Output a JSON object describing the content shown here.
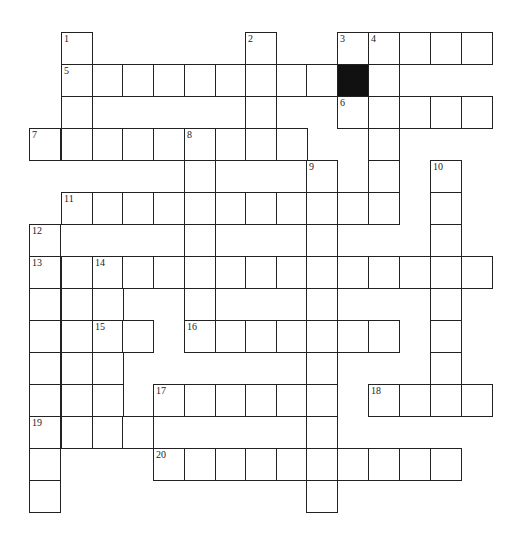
{
  "puzzle": {
    "type": "crossword",
    "colors": {
      "grid_line": "#222222",
      "block": "#111111",
      "background": "#ffffff"
    },
    "geometry": {
      "col_left": [
        29,
        61,
        92,
        122,
        153,
        184,
        215,
        245,
        276,
        306,
        337,
        368,
        399,
        430,
        461
      ],
      "row_top": [
        32,
        64,
        96,
        128,
        160,
        192,
        224,
        256,
        288,
        320,
        352,
        384,
        416,
        448,
        480
      ],
      "cell_w": 32,
      "cell_h": 33
    },
    "cells": [
      {
        "r": 0,
        "c": 1,
        "n": "1"
      },
      {
        "r": 0,
        "c": 7,
        "n": "2"
      },
      {
        "r": 0,
        "c": 10,
        "n": "3"
      },
      {
        "r": 0,
        "c": 11,
        "n": "4"
      },
      {
        "r": 0,
        "c": 12
      },
      {
        "r": 0,
        "c": 13
      },
      {
        "r": 0,
        "c": 14
      },
      {
        "r": 1,
        "c": 1,
        "n": "5"
      },
      {
        "r": 1,
        "c": 2
      },
      {
        "r": 1,
        "c": 3
      },
      {
        "r": 1,
        "c": 4
      },
      {
        "r": 1,
        "c": 5
      },
      {
        "r": 1,
        "c": 6
      },
      {
        "r": 1,
        "c": 7
      },
      {
        "r": 1,
        "c": 8
      },
      {
        "r": 1,
        "c": 9
      },
      {
        "r": 1,
        "c": 10,
        "black": true
      },
      {
        "r": 1,
        "c": 11
      },
      {
        "r": 2,
        "c": 1
      },
      {
        "r": 2,
        "c": 7
      },
      {
        "r": 2,
        "c": 10,
        "n": "6"
      },
      {
        "r": 2,
        "c": 11
      },
      {
        "r": 2,
        "c": 12
      },
      {
        "r": 2,
        "c": 13
      },
      {
        "r": 2,
        "c": 14
      },
      {
        "r": 3,
        "c": 0,
        "n": "7"
      },
      {
        "r": 3,
        "c": 1
      },
      {
        "r": 3,
        "c": 2
      },
      {
        "r": 3,
        "c": 3
      },
      {
        "r": 3,
        "c": 4
      },
      {
        "r": 3,
        "c": 5,
        "n": "8"
      },
      {
        "r": 3,
        "c": 6
      },
      {
        "r": 3,
        "c": 7
      },
      {
        "r": 3,
        "c": 8
      },
      {
        "r": 3,
        "c": 11
      },
      {
        "r": 4,
        "c": 5
      },
      {
        "r": 4,
        "c": 9,
        "n": "9"
      },
      {
        "r": 4,
        "c": 11
      },
      {
        "r": 4,
        "c": 13,
        "n": "10"
      },
      {
        "r": 5,
        "c": 1,
        "n": "11"
      },
      {
        "r": 5,
        "c": 2
      },
      {
        "r": 5,
        "c": 3
      },
      {
        "r": 5,
        "c": 4
      },
      {
        "r": 5,
        "c": 5
      },
      {
        "r": 5,
        "c": 6
      },
      {
        "r": 5,
        "c": 7
      },
      {
        "r": 5,
        "c": 8
      },
      {
        "r": 5,
        "c": 9
      },
      {
        "r": 5,
        "c": 10
      },
      {
        "r": 5,
        "c": 11
      },
      {
        "r": 5,
        "c": 13
      },
      {
        "r": 6,
        "c": 0,
        "n": "12"
      },
      {
        "r": 6,
        "c": 5
      },
      {
        "r": 6,
        "c": 9
      },
      {
        "r": 6,
        "c": 13
      },
      {
        "r": 7,
        "c": 0,
        "n": "13"
      },
      {
        "r": 7,
        "c": 1
      },
      {
        "r": 7,
        "c": 2,
        "n": "14"
      },
      {
        "r": 7,
        "c": 3
      },
      {
        "r": 7,
        "c": 4
      },
      {
        "r": 7,
        "c": 5
      },
      {
        "r": 7,
        "c": 6
      },
      {
        "r": 7,
        "c": 7
      },
      {
        "r": 7,
        "c": 8
      },
      {
        "r": 7,
        "c": 9
      },
      {
        "r": 7,
        "c": 10
      },
      {
        "r": 7,
        "c": 11
      },
      {
        "r": 7,
        "c": 12
      },
      {
        "r": 7,
        "c": 13
      },
      {
        "r": 7,
        "c": 14
      },
      {
        "r": 8,
        "c": 0
      },
      {
        "r": 8,
        "c": 1
      },
      {
        "r": 8,
        "c": 2
      },
      {
        "r": 8,
        "c": 5
      },
      {
        "r": 8,
        "c": 9
      },
      {
        "r": 8,
        "c": 13
      },
      {
        "r": 9,
        "c": 0
      },
      {
        "r": 9,
        "c": 1
      },
      {
        "r": 9,
        "c": 2,
        "n": "15"
      },
      {
        "r": 9,
        "c": 3
      },
      {
        "r": 9,
        "c": 5,
        "n": "16"
      },
      {
        "r": 9,
        "c": 6
      },
      {
        "r": 9,
        "c": 7
      },
      {
        "r": 9,
        "c": 8
      },
      {
        "r": 9,
        "c": 9
      },
      {
        "r": 9,
        "c": 10
      },
      {
        "r": 9,
        "c": 11
      },
      {
        "r": 9,
        "c": 13
      },
      {
        "r": 10,
        "c": 0
      },
      {
        "r": 10,
        "c": 1
      },
      {
        "r": 10,
        "c": 2
      },
      {
        "r": 10,
        "c": 9
      },
      {
        "r": 10,
        "c": 13
      },
      {
        "r": 11,
        "c": 0
      },
      {
        "r": 11,
        "c": 1
      },
      {
        "r": 11,
        "c": 2
      },
      {
        "r": 11,
        "c": 4,
        "n": "17"
      },
      {
        "r": 11,
        "c": 5
      },
      {
        "r": 11,
        "c": 6
      },
      {
        "r": 11,
        "c": 7
      },
      {
        "r": 11,
        "c": 8
      },
      {
        "r": 11,
        "c": 9
      },
      {
        "r": 11,
        "c": 11,
        "n": "18"
      },
      {
        "r": 11,
        "c": 12
      },
      {
        "r": 11,
        "c": 13
      },
      {
        "r": 11,
        "c": 14
      },
      {
        "r": 12,
        "c": 0,
        "n": "19"
      },
      {
        "r": 12,
        "c": 1
      },
      {
        "r": 12,
        "c": 2
      },
      {
        "r": 12,
        "c": 3
      },
      {
        "r": 12,
        "c": 9
      },
      {
        "r": 13,
        "c": 0
      },
      {
        "r": 13,
        "c": 4,
        "n": "20"
      },
      {
        "r": 13,
        "c": 5
      },
      {
        "r": 13,
        "c": 6
      },
      {
        "r": 13,
        "c": 7
      },
      {
        "r": 13,
        "c": 8
      },
      {
        "r": 13,
        "c": 9
      },
      {
        "r": 13,
        "c": 10
      },
      {
        "r": 13,
        "c": 11
      },
      {
        "r": 13,
        "c": 12
      },
      {
        "r": 13,
        "c": 13
      },
      {
        "r": 14,
        "c": 0
      },
      {
        "r": 14,
        "c": 9
      }
    ],
    "clue_numbers": [
      "1",
      "2",
      "3",
      "4",
      "5",
      "6",
      "7",
      "8",
      "9",
      "10",
      "11",
      "12",
      "13",
      "14",
      "15",
      "16",
      "17",
      "18",
      "19",
      "20"
    ]
  }
}
